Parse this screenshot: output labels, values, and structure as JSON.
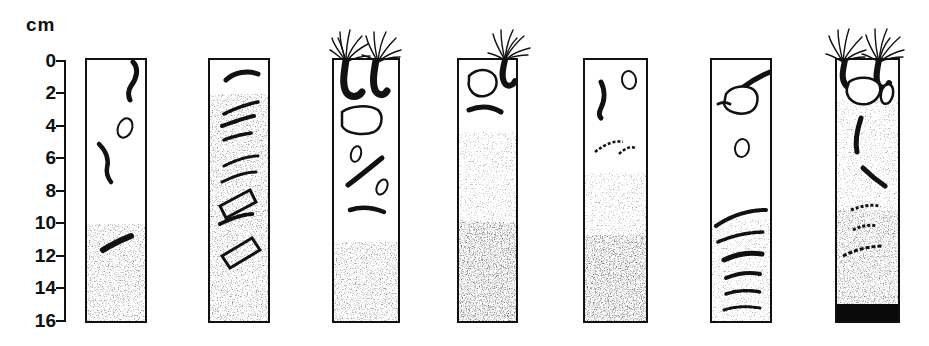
{
  "figure": {
    "type": "sediment-core-profile-diagram",
    "axis": {
      "unit_label": "cm",
      "tick_labels": [
        "0",
        "2",
        "4",
        "6",
        "8",
        "10",
        "12",
        "14",
        "16"
      ],
      "tick_values": [
        0,
        2,
        4,
        6,
        8,
        10,
        12,
        14,
        16
      ],
      "range_cm": [
        0,
        16
      ],
      "orientation": "vertical-downward",
      "px_per_cm": 16.25,
      "top_px": 60
    },
    "colors": {
      "ink": "#111111",
      "core_fill": "#ffffff",
      "sediment_stipple": "#1a1a1a",
      "black_layer": "#0a0a0a"
    },
    "cores": [
      {
        "index": 1,
        "x": 85,
        "width": 62,
        "top_cm": 0,
        "bottom_cm": 16.2,
        "sediment_top_cm": 10.0,
        "sediment_style": "uniform-stipple",
        "black_layer": false,
        "tube_worms": 0,
        "fauna_count": 3
      },
      {
        "index": 2,
        "x": 208,
        "width": 62,
        "top_cm": 0,
        "bottom_cm": 16.2,
        "sediment_top_cm": 2.0,
        "sediment_style": "uniform-stipple",
        "black_layer": false,
        "tube_worms": 0,
        "fauna_count": 8
      },
      {
        "index": 3,
        "x": 332,
        "width": 68,
        "top_cm": 0,
        "bottom_cm": 16.2,
        "sediment_top_cm": 11.2,
        "sediment_style": "uniform-stipple",
        "black_layer": false,
        "tube_worms": 2,
        "fauna_count": 6
      },
      {
        "index": 4,
        "x": 457,
        "width": 61,
        "top_cm": 0,
        "bottom_cm": 16.2,
        "sediment_top_cm": 4.4,
        "sediment_style": "graded-stipple",
        "black_layer": false,
        "tube_worms": 1,
        "fauna_count": 2
      },
      {
        "index": 5,
        "x": 583,
        "width": 65,
        "top_cm": 0,
        "bottom_cm": 16.2,
        "sediment_top_cm": 6.9,
        "sediment_style": "graded-stipple",
        "black_layer": false,
        "tube_worms": 0,
        "fauna_count": 3
      },
      {
        "index": 6,
        "x": 710,
        "width": 62,
        "top_cm": 0,
        "bottom_cm": 16.2,
        "sediment_top_cm": 9.7,
        "sediment_style": "stipple-with-burrow-bands",
        "black_layer": false,
        "tube_worms": 0,
        "fauna_count": 6
      },
      {
        "index": 7,
        "x": 835,
        "width": 65,
        "top_cm": 0,
        "bottom_cm": 16.2,
        "sediment_top_cm": 2.4,
        "sediment_style": "graded-stipple",
        "black_layer": true,
        "black_layer_top_cm": 14.9,
        "tube_worms": 2,
        "fauna_count": 7
      }
    ]
  }
}
